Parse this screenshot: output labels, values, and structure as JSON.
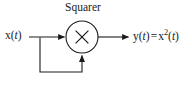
{
  "diagram": {
    "kind": "block-diagram",
    "title": "Squarer",
    "background_color": "#ffffff",
    "line_color": "#1a1a1a",
    "text_color": "#1a1a1a",
    "width": 192,
    "height": 85,
    "block_label": "Squarer",
    "operator_symbol": "×",
    "operator_name": "multiplier",
    "input_signal": {
      "function_name": "x",
      "variable": "t",
      "full_text": "x(t)"
    },
    "output_signal": {
      "function_name": "y",
      "variable": "t",
      "equals": "=",
      "expression_base": "x",
      "expression_exponent": "2",
      "full_text": "y(t) = x²(t)"
    },
    "nodes": [
      {
        "id": "multiplier",
        "label": "×",
        "shape": "circle",
        "cx": 82,
        "cy": 37,
        "r": 16
      }
    ],
    "edges": [
      {
        "id": "input-edge",
        "from": "x(t)",
        "to": "multiplier",
        "direction": "left-to-right",
        "arrow": true
      },
      {
        "id": "feedback-edge",
        "from": "input-tap",
        "to": "multiplier",
        "direction": "bottom-up",
        "arrow": true
      },
      {
        "id": "output-edge",
        "from": "multiplier",
        "to": "y(t) = x²(t)",
        "direction": "left-to-right",
        "arrow": true
      }
    ]
  }
}
